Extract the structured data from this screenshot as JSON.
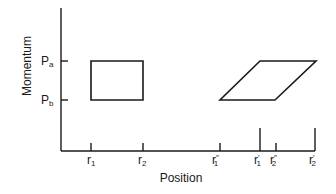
{
  "diagram": {
    "type": "phase-space",
    "x_axis": {
      "title": "Position",
      "ticks": [
        {
          "id": "r1",
          "base": "r",
          "sub": "1",
          "prime": "",
          "x": 91,
          "tall": false
        },
        {
          "id": "r2",
          "base": "r",
          "sub": "2",
          "prime": "",
          "x": 143,
          "tall": false
        },
        {
          "id": "r1pp",
          "base": "r",
          "sub": "1",
          "prime": "″",
          "x": 220,
          "tall": false
        },
        {
          "id": "r1p",
          "base": "r",
          "sub": "1",
          "prime": "′",
          "x": 260,
          "tall": true
        },
        {
          "id": "r2pp",
          "base": "r",
          "sub": "2",
          "prime": "″",
          "x": 276,
          "tall": false
        },
        {
          "id": "r2p",
          "base": "r",
          "sub": "2",
          "prime": "′",
          "x": 315,
          "tall": true
        }
      ]
    },
    "y_axis": {
      "title": "Momentum",
      "ticks": [
        {
          "id": "pa",
          "base": "P",
          "sub": "a",
          "y": 61
        },
        {
          "id": "pb",
          "base": "P",
          "sub": "b",
          "y": 100
        }
      ]
    },
    "shapes": [
      {
        "name": "initial-rectangle",
        "points": "91,61 143,61 143,100 91,100"
      },
      {
        "name": "sheared-parallelogram",
        "points": "220,100 275,100 316,61 260,61"
      }
    ]
  }
}
